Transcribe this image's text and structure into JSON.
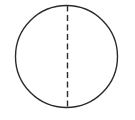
{
  "diagram": {
    "shape": "circle",
    "center": {
      "x": 66.5,
      "y": 56.5
    },
    "radius": 51,
    "stroke_color": "#2a2a2a",
    "stroke_width": 1.4,
    "diameter_line": {
      "style": "dashed",
      "orientation": "vertical",
      "x": 67.5,
      "y1": 5.5,
      "y2": 108,
      "dash": "6,3.5",
      "color": "#2a2a2a"
    }
  }
}
